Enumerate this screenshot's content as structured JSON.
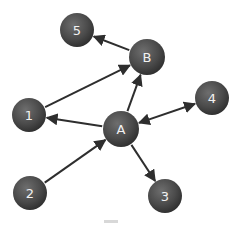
{
  "diagram": {
    "type": "directed-graph",
    "colors": {
      "node_fill": "#4a4a4a",
      "node_highlight": "#6e6e6e",
      "node_shadow": "#2c2c2c",
      "label": "#f2f2f2",
      "edge": "#2e2e2e",
      "background": "#ffffff"
    },
    "nodes": [
      {
        "id": "5",
        "label": "5",
        "cx": 77,
        "cy": 30,
        "r": 17
      },
      {
        "id": "B",
        "label": "B",
        "cx": 147,
        "cy": 57,
        "r": 18
      },
      {
        "id": "4",
        "label": "4",
        "cx": 212,
        "cy": 98,
        "r": 17
      },
      {
        "id": "1",
        "label": "1",
        "cx": 29,
        "cy": 115,
        "r": 17
      },
      {
        "id": "A",
        "label": "A",
        "cx": 121,
        "cy": 129,
        "r": 18
      },
      {
        "id": "2",
        "label": "2",
        "cx": 30,
        "cy": 193,
        "r": 17
      },
      {
        "id": "3",
        "label": "3",
        "cx": 165,
        "cy": 196,
        "r": 17
      }
    ],
    "edges": [
      {
        "from": "B",
        "to": "5",
        "bidirectional": false
      },
      {
        "from": "1",
        "to": "B",
        "bidirectional": false
      },
      {
        "from": "A",
        "to": "B",
        "bidirectional": false
      },
      {
        "from": "A",
        "to": "1",
        "bidirectional": false
      },
      {
        "from": "A",
        "to": "4",
        "bidirectional": true
      },
      {
        "from": "2",
        "to": "A",
        "bidirectional": false
      },
      {
        "from": "A",
        "to": "3",
        "bidirectional": false
      }
    ]
  }
}
